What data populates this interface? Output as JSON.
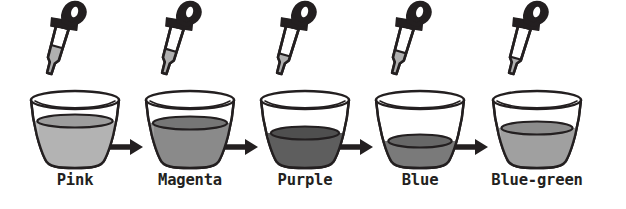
{
  "figure": {
    "background_color": "#ffffff",
    "ink_color": "#231f20",
    "stage_count": 5,
    "arrow_count": 4,
    "arrow_symbol": "right-arrow"
  },
  "stages": [
    {
      "label": "Pink",
      "liquid_color": "#b3b3b3",
      "liquid_top_color": "#9d9d9d",
      "fill_level": "high",
      "dropper": {
        "bulb_color": "#231f20",
        "tube_liquid_color": "#b0b0b0",
        "tube_liquid_amount": "high"
      }
    },
    {
      "label": "Magenta",
      "liquid_color": "#8a8a8a",
      "liquid_top_color": "#767676",
      "fill_level": "high",
      "dropper": {
        "bulb_color": "#231f20",
        "tube_liquid_color": "#b0b0b0",
        "tube_liquid_amount": "medium-high"
      }
    },
    {
      "label": "Purple",
      "liquid_color": "#5e5e5e",
      "liquid_top_color": "#4f4f4f",
      "fill_level": "medium",
      "dropper": {
        "bulb_color": "#231f20",
        "tube_liquid_color": "#b0b0b0",
        "tube_liquid_amount": "medium"
      }
    },
    {
      "label": "Blue",
      "liquid_color": "#7a7a7a",
      "liquid_top_color": "#676767",
      "fill_level": "low",
      "dropper": {
        "bulb_color": "#231f20",
        "tube_liquid_color": "#b0b0b0",
        "tube_liquid_amount": "medium-low"
      }
    },
    {
      "label": "Blue-green",
      "liquid_color": "#a0a0a0",
      "liquid_top_color": "#8c8c8c",
      "fill_level": "medium-high",
      "dropper": {
        "bulb_color": "#231f20",
        "tube_liquid_color": "#b0b0b0",
        "tube_liquid_amount": "low"
      }
    }
  ]
}
